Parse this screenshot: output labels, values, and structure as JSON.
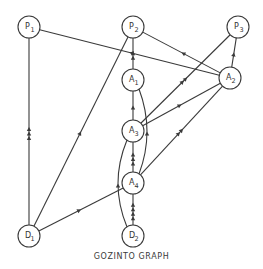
{
  "diagram": {
    "caption": "GOZINTO GRAPH",
    "colors": {
      "stroke": "#3a3a3a",
      "text": "#333333",
      "background": "#ffffff"
    },
    "nodes": [
      {
        "id": "P1",
        "letter": "P",
        "sub": "1",
        "x": 29,
        "y": 27
      },
      {
        "id": "P2",
        "letter": "P",
        "sub": "2",
        "x": 133,
        "y": 27
      },
      {
        "id": "P3",
        "letter": "P",
        "sub": "3",
        "x": 238,
        "y": 27
      },
      {
        "id": "A1",
        "letter": "A",
        "sub": "1",
        "x": 133,
        "y": 80
      },
      {
        "id": "A2",
        "letter": "A",
        "sub": "2",
        "x": 230,
        "y": 78
      },
      {
        "id": "A3",
        "letter": "A",
        "sub": "3",
        "x": 133,
        "y": 131
      },
      {
        "id": "A4",
        "letter": "A",
        "sub": "4",
        "x": 133,
        "y": 183
      },
      {
        "id": "D1",
        "letter": "D",
        "sub": "1",
        "x": 29,
        "y": 236
      },
      {
        "id": "D2",
        "letter": "D",
        "sub": "2",
        "x": 133,
        "y": 236
      }
    ],
    "edges": [
      {
        "from": "D1",
        "to": "P1",
        "arrows": 3
      },
      {
        "from": "D1",
        "to": "P2",
        "arrows": 1
      },
      {
        "from": "D1",
        "to": "A4",
        "arrows": 1
      },
      {
        "from": "A2",
        "to": "P1",
        "arrows": 1
      },
      {
        "from": "A2",
        "to": "P2",
        "arrows": 1
      },
      {
        "from": "A2",
        "to": "P3",
        "arrows": 1
      },
      {
        "from": "A1",
        "to": "P2",
        "arrows": 2
      },
      {
        "from": "A3",
        "to": "A1",
        "arrows": 1
      },
      {
        "from": "A3",
        "to": "P3",
        "arrows": 2
      },
      {
        "from": "A3",
        "to": "A2",
        "arrows": 1
      },
      {
        "from": "A4",
        "to": "A3",
        "arrows": 3
      },
      {
        "from": "A4",
        "to": "A2",
        "arrows": 2
      },
      {
        "from": "A4",
        "to": "A1",
        "arrows": 1,
        "curve": "right"
      },
      {
        "from": "D2",
        "to": "A4",
        "arrows": 4
      },
      {
        "from": "D2",
        "to": "A3",
        "arrows": 1,
        "curve": "left"
      }
    ]
  }
}
